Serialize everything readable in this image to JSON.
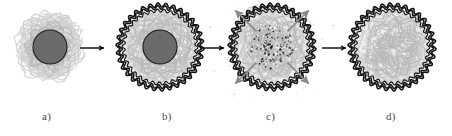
{
  "figure": {
    "type": "scientific-diagram",
    "background_color": "#ffffff",
    "width": 452,
    "height": 136,
    "panel_count": 4
  },
  "colors": {
    "background": "#ffffff",
    "core_fill": "#6b6b6b",
    "core_stroke": "#1c1c1c",
    "corona_light": "#cfcfcf",
    "corona_mid": "#b9b9b9",
    "shell_dark": "#111111",
    "arrow_black": "#141414",
    "arrow_gray": "#8a8a8a",
    "speck_black": "#181818",
    "label_color": "#4a4a4a"
  },
  "panels": [
    {
      "id": "a",
      "label": "a)",
      "label_x": 48,
      "label_y": 110,
      "center_x": 50,
      "center_y": 47,
      "corona_radius": 33,
      "core_radius": 17,
      "has_core": true,
      "has_dark_shell": false,
      "has_specks": false,
      "has_burst_arrows": false,
      "description": "template particle with loose polymer corona"
    },
    {
      "id": "b",
      "label": "b)",
      "label_x": 168,
      "label_y": 110,
      "center_x": 160,
      "center_y": 47,
      "corona_radius": 40,
      "core_radius": 17,
      "has_core": true,
      "has_dark_shell": true,
      "has_specks": false,
      "has_burst_arrows": false,
      "description": "crosslinked shell formed around core-corona particle"
    },
    {
      "id": "c",
      "label": "c)",
      "label_x": 272,
      "label_y": 110,
      "center_x": 272,
      "center_y": 47,
      "corona_radius": 40,
      "core_radius": 0,
      "has_core": false,
      "has_dark_shell": true,
      "has_specks": true,
      "has_burst_arrows": true,
      "description": "core degraded into fragments diffusing out of the shell"
    },
    {
      "id": "d",
      "label": "d)",
      "label_x": 392,
      "label_y": 110,
      "center_x": 392,
      "center_y": 47,
      "corona_radius": 40,
      "core_radius": 0,
      "has_core": false,
      "has_dark_shell": true,
      "has_specks": false,
      "has_burst_arrows": false,
      "description": "hollow nanocapsule after complete core removal"
    }
  ],
  "process_arrows": [
    {
      "id": "arrow-a-b",
      "x1": 80,
      "y1": 48,
      "x2": 104,
      "y2": 48,
      "color": "#141414"
    },
    {
      "id": "arrow-b-c",
      "x1": 200,
      "y1": 48,
      "x2": 224,
      "y2": 48,
      "color": "#141414"
    },
    {
      "id": "arrow-c-d",
      "x1": 322,
      "y1": 48,
      "x2": 346,
      "y2": 48,
      "color": "#141414"
    }
  ],
  "burst_arrows": {
    "panel": "c",
    "count": 4,
    "color": "#8a8a8a",
    "directions": [
      "up-left",
      "up-right",
      "down-left",
      "down-right"
    ],
    "inner_radius": 22,
    "outer_radius": 52
  }
}
